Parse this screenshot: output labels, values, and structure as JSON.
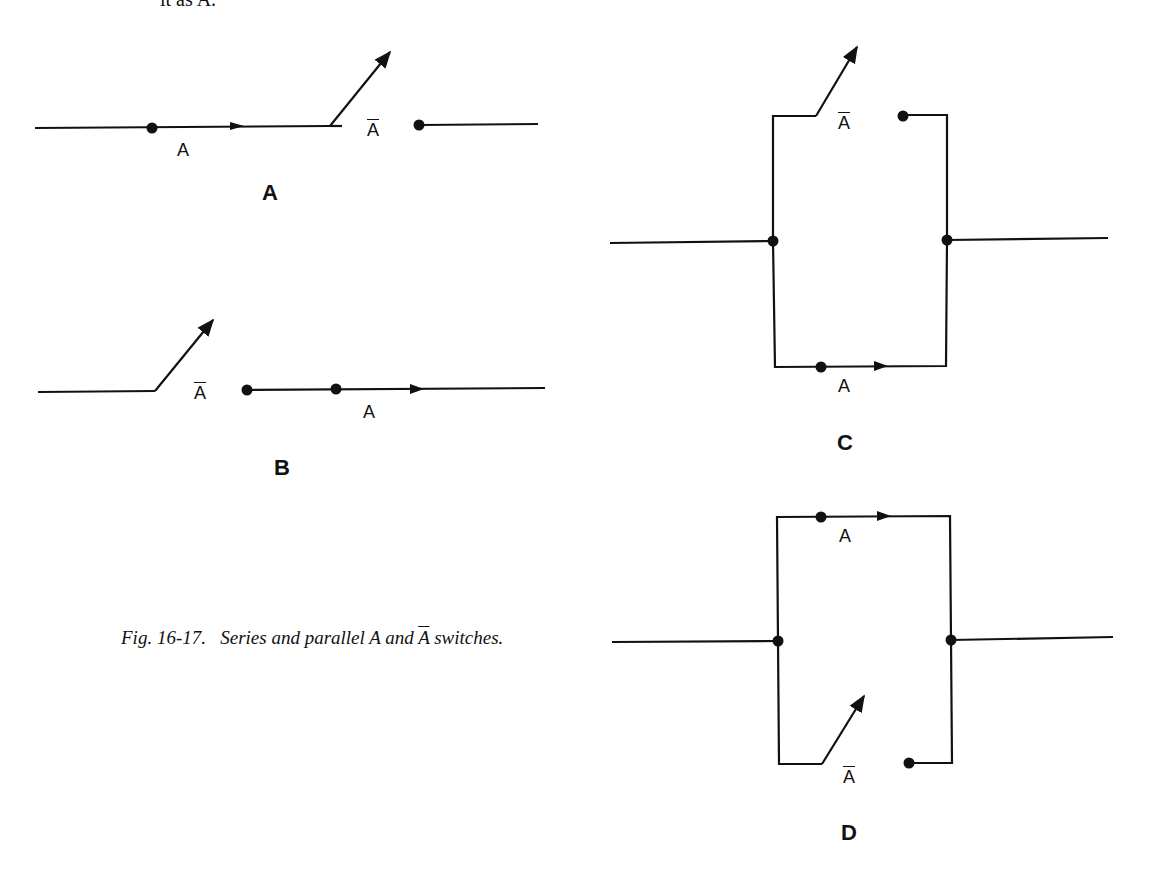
{
  "page_fragment": "it as A.",
  "caption": {
    "prefix": "Fig. 16-17.",
    "text_before": "Series and parallel A and ",
    "overlined": "A",
    "text_after": " switches."
  },
  "switch_labels": {
    "closed": "A",
    "open": "A"
  },
  "panels": [
    {
      "id": "A",
      "label": "A",
      "description": "Series: A switch (closed) then A-bar switch (open)"
    },
    {
      "id": "B",
      "label": "B",
      "description": "Series: A-bar switch (open) then A switch (closed)"
    },
    {
      "id": "C",
      "label": "C",
      "description": "Parallel: A-bar switch (open) top branch, A switch (closed) bottom branch"
    },
    {
      "id": "D",
      "label": "D",
      "description": "Parallel: A switch (closed) top branch, A-bar switch (open) bottom branch"
    }
  ],
  "colors": {
    "ink": "#111111",
    "background": "#ffffff"
  }
}
